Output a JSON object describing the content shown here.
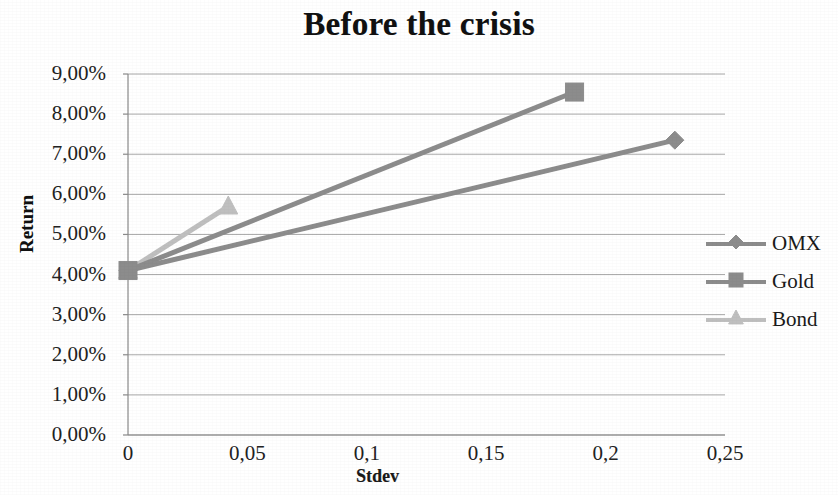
{
  "chart_data": {
    "type": "line",
    "title": "Before the crisis",
    "xlabel": "Stdev",
    "ylabel": "Return",
    "xlim": [
      0,
      0.25
    ],
    "ylim": [
      0,
      0.09
    ],
    "grid": true,
    "legend_position": "right",
    "x_tick_labels": [
      "0",
      "0,05",
      "0,1",
      "0,15",
      "0,2",
      "0,25"
    ],
    "x_tick_values": [
      0,
      0.05,
      0.1,
      0.15,
      0.2,
      0.25
    ],
    "y_tick_labels": [
      "0,00%",
      "1,00%",
      "2,00%",
      "3,00%",
      "4,00%",
      "5,00%",
      "6,00%",
      "7,00%",
      "8,00%",
      "9,00%"
    ],
    "y_tick_values": [
      0,
      1,
      2,
      3,
      4,
      5,
      6,
      7,
      8,
      9
    ],
    "series": [
      {
        "name": "OMX",
        "marker": "diamond",
        "color": "#8c8c8c",
        "points": [
          {
            "x": 0,
            "y": 4.1
          },
          {
            "x": 0.229,
            "y": 7.35
          }
        ]
      },
      {
        "name": "Gold",
        "marker": "square",
        "color": "#8c8c8c",
        "points": [
          {
            "x": 0,
            "y": 4.1
          },
          {
            "x": 0.187,
            "y": 8.55
          }
        ]
      },
      {
        "name": "Bond",
        "marker": "triangle",
        "color": "#bfbfbf",
        "points": [
          {
            "x": 0,
            "y": 4.1
          },
          {
            "x": 0.042,
            "y": 5.7
          }
        ]
      }
    ]
  }
}
